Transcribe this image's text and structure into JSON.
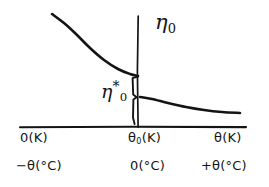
{
  "figure": {
    "background_color": "#ffffff",
    "ink_color": "#141414",
    "width": 269,
    "height": 187,
    "style": "hand-drawn sketch"
  },
  "labels": {
    "vertical_axis_symbol": "η",
    "vertical_axis_subscript": "0",
    "brace_symbol": "η",
    "brace_subscript": "0",
    "brace_superscript": "*",
    "x_axis_kelvin_left": "0(K)",
    "x_axis_kelvin_origin": "θ",
    "x_axis_kelvin_origin_sub": "0",
    "x_axis_kelvin_origin_tail": "(K)",
    "x_axis_kelvin_right": "θ(K)",
    "x_axis_celsius_left": "−θ(°C)",
    "x_axis_celsius_origin": "0(°C)",
    "x_axis_celsius_right": "+θ(°C)"
  },
  "chart_data": {
    "type": "line",
    "title": "",
    "xlabel": "θ",
    "ylabel": "η",
    "grid": false,
    "legend": "none",
    "axes": {
      "x_axis_y_pixel": 127,
      "x_axis_x_start": 20,
      "x_axis_x_end": 246,
      "vertical_line_x_pixel": 138,
      "vertical_line_y_top": 16,
      "vertical_line_y_bottom": 127
    },
    "annotations": [
      {
        "name": "eta-zero-axis-label",
        "text": "η₀",
        "x": 155,
        "y": 22,
        "meaning": "value of eta at the vertical axis"
      },
      {
        "name": "eta-zero-star-brace-label",
        "text": "η₀*",
        "x": 108,
        "y": 90,
        "meaning": "discontinuity jump magnitude marked by brace"
      }
    ],
    "tick_labels": {
      "kelvin_scale": [
        "0(K)",
        "θ₀(K)",
        "θ(K)"
      ],
      "celsius_scale": [
        "−θ(°C)",
        "0(°C)",
        "+θ(°C)"
      ]
    },
    "series": [
      {
        "name": "upper-branch",
        "description": "decaying curve from upper-left descending to the vertical line at theta-zero",
        "path_points": [
          [
            52,
            14
          ],
          [
            64,
            23
          ],
          [
            76,
            34
          ],
          [
            90,
            48
          ],
          [
            104,
            60
          ],
          [
            118,
            69
          ],
          [
            130,
            74
          ],
          [
            138,
            76
          ]
        ]
      },
      {
        "name": "lower-branch",
        "description": "curve starting just right of theta-zero at a lower value, flattening toward the right",
        "path_points": [
          [
            140,
            97
          ],
          [
            152,
            99
          ],
          [
            168,
            103
          ],
          [
            186,
            107
          ],
          [
            204,
            110
          ],
          [
            222,
            112
          ],
          [
            240,
            113
          ]
        ]
      }
    ],
    "brace": {
      "name": "eta-zero-star-brace",
      "x": 133,
      "y_top": 76,
      "y_bottom": 120,
      "orientation": "vertical-left-of-axis",
      "spans": "gap between upper branch endpoint and lower branch start"
    }
  }
}
